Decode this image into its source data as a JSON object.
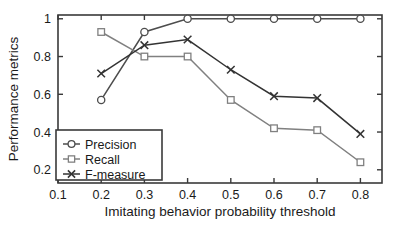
{
  "chart_data": {
    "type": "line",
    "title": "",
    "xlabel": "Imitating behavior probability threshold",
    "ylabel": "Performance metrics",
    "x": [
      0.2,
      0.3,
      0.4,
      0.5,
      0.6,
      0.7,
      0.8
    ],
    "xlim": [
      0.1,
      0.85
    ],
    "ylim": [
      0.13,
      1.02
    ],
    "xticks": [
      0.1,
      0.2,
      0.3,
      0.4,
      0.5,
      0.6,
      0.7,
      0.8
    ],
    "xticklabels": [
      "0.1",
      "0.2",
      "0.3",
      "0.4",
      "0.5",
      "0.6",
      "0.7",
      "0.8"
    ],
    "yticks": [
      0.2,
      0.4,
      0.6,
      0.8,
      1.0
    ],
    "yticklabels": [
      "0.2",
      "0.4",
      "0.6",
      "0.8",
      "1"
    ],
    "grid": false,
    "legend_position": "lower left",
    "series": [
      {
        "name": "Precision",
        "marker": "circle-marker",
        "color": "#4d4d4d",
        "values": [
          0.57,
          0.93,
          1.0,
          1.0,
          1.0,
          1.0,
          1.0
        ]
      },
      {
        "name": "Recall",
        "marker": "square-marker",
        "color": "#808080",
        "values": [
          0.93,
          0.8,
          0.8,
          0.57,
          0.42,
          0.41,
          0.24
        ]
      },
      {
        "name": "F-measure",
        "marker": "x-marker",
        "color": "#333333",
        "values": [
          0.71,
          0.86,
          0.89,
          0.73,
          0.59,
          0.58,
          0.39
        ]
      }
    ]
  },
  "legend": {
    "items": [
      {
        "label": "Precision",
        "marker": "circle-marker"
      },
      {
        "label": "Recall",
        "marker": "square-marker"
      },
      {
        "label": "F-measure",
        "marker": "x-marker"
      }
    ]
  },
  "axes": {
    "x_title": "Imitating behavior probability threshold",
    "y_title": "Performance metrics"
  }
}
